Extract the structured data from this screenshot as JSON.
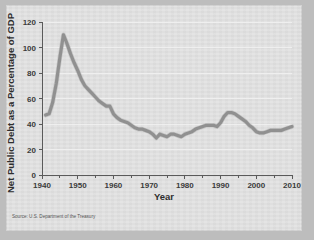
{
  "figure": {
    "background_color": "#bdbdbd",
    "panel_color": "#e2e2e2",
    "source_note": "Source: U.S. Department of the Treasury"
  },
  "chart_data": {
    "type": "line",
    "title": "",
    "subtitle": "",
    "xlabel": "Year",
    "ylabel": "Net Public Debt as a Percentage of GDP",
    "xlim": [
      1940,
      2010
    ],
    "ylim": [
      0,
      120
    ],
    "grid": true,
    "legend": "none",
    "line_color": "#8d8d8d",
    "x_ticks": [
      1940,
      1950,
      1960,
      1970,
      1980,
      1990,
      2000,
      2010
    ],
    "x_tick_labels": [
      "1940",
      "1950",
      "1960",
      "1970",
      "1980",
      "1990",
      "2000",
      "2010"
    ],
    "x_minor_ticks": [
      1945,
      1955,
      1965,
      1975,
      1985,
      1995,
      2005
    ],
    "y_ticks": [
      0,
      20,
      40,
      60,
      80,
      100,
      120
    ],
    "y_tick_labels": [
      "0",
      "20",
      "40",
      "60",
      "80",
      "100",
      "120"
    ],
    "series": [
      {
        "name": "Net Public Debt as a Percentage of GDP",
        "x": [
          1941,
          1942,
          1943,
          1944,
          1945,
          1946,
          1947,
          1948,
          1949,
          1950,
          1951,
          1952,
          1953,
          1954,
          1955,
          1956,
          1957,
          1958,
          1959,
          1960,
          1961,
          1962,
          1963,
          1964,
          1965,
          1966,
          1967,
          1968,
          1969,
          1970,
          1971,
          1972,
          1973,
          1974,
          1975,
          1976,
          1977,
          1978,
          1979,
          1980,
          1981,
          1982,
          1983,
          1984,
          1985,
          1986,
          1987,
          1988,
          1989,
          1990,
          1991,
          1992,
          1993,
          1994,
          1995,
          1996,
          1997,
          1998,
          1999,
          2000,
          2001,
          2002,
          2003,
          2004,
          2005,
          2006,
          2007,
          2008,
          2009,
          2010
        ],
        "values": [
          47,
          48,
          57,
          72,
          92,
          110,
          103,
          95,
          88,
          82,
          75,
          70,
          67,
          64,
          61,
          58,
          56,
          54,
          54,
          48,
          45,
          43,
          42,
          41,
          39,
          37,
          36,
          36,
          35,
          34,
          32,
          29,
          32,
          31,
          30,
          32,
          32,
          31,
          30,
          32,
          33,
          34,
          36,
          37,
          38,
          39,
          39,
          39,
          38,
          41,
          46,
          49,
          49,
          48,
          46,
          44,
          42,
          39,
          37,
          34,
          33,
          33,
          34,
          35,
          35,
          35,
          35,
          36,
          37,
          38
        ],
        "color": "#8d8d8d"
      }
    ],
    "annotations": []
  },
  "axes": {
    "y_title": "Net Public Debt as a Percentage of GDP",
    "x_title": "Year"
  }
}
